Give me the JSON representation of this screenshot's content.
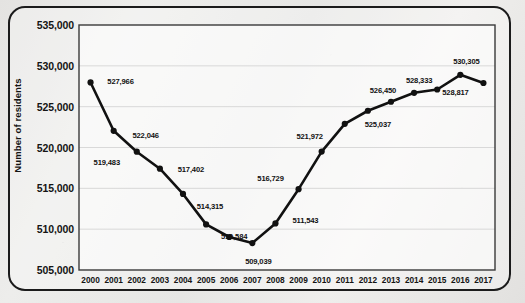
{
  "chart_data": {
    "type": "line",
    "title": "",
    "xlabel": "",
    "ylabel": "Number of residents",
    "ylim": [
      505000,
      535000
    ],
    "ytick_labels": [
      "535,000",
      "530,000",
      "525,000",
      "520,000",
      "515,000",
      "510,000",
      "505,000"
    ],
    "ytick_values": [
      535000,
      530000,
      525000,
      520000,
      515000,
      510000,
      505000
    ],
    "grid": true,
    "legend": "none",
    "categories": [
      "2000",
      "2001",
      "2002",
      "2003",
      "2004",
      "2005",
      "2006",
      "2007",
      "2008",
      "2009",
      "2010",
      "2011",
      "2012",
      "2013",
      "2014",
      "2015",
      "2016",
      "2017"
    ],
    "values": [
      527966,
      522046,
      519483,
      517402,
      514315,
      510584,
      509039,
      509039,
      511543,
      516729,
      521972,
      525037,
      526450,
      528333,
      528333,
      530305,
      530305,
      528817
    ],
    "points": [
      {
        "x": "2000",
        "y": 527966,
        "label": "527,966",
        "lx": 30,
        "ly": -1
      },
      {
        "x": "2001",
        "y": 522046,
        "label": "522,046",
        "lx": 32,
        "ly": 4
      },
      {
        "x": "2002",
        "y": 519483,
        "label": "519,483",
        "lx": -30,
        "ly": 10
      },
      {
        "x": "2003",
        "y": 517402,
        "label": "517,402",
        "lx": 31,
        "ly": 0
      },
      {
        "x": "2004",
        "y": 514315,
        "label": "514,315",
        "lx": 27,
        "ly": 12
      },
      {
        "x": "2005",
        "y": 510584,
        "label": "510,584",
        "lx": 28,
        "ly": 12
      },
      {
        "x": "2006",
        "y": 509039,
        "label": "",
        "lx": 0,
        "ly": 0
      },
      {
        "x": "2007",
        "y": 508300,
        "label": "509,039",
        "lx": 6,
        "ly": 18
      },
      {
        "x": "2008",
        "y": 510700,
        "label": "511,543",
        "lx": 30,
        "ly": -3
      },
      {
        "x": "2009",
        "y": 514900,
        "label": "516,729",
        "lx": -28,
        "ly": -11
      },
      {
        "x": "2010",
        "y": 519500,
        "label": "521,972",
        "lx": -12,
        "ly": -16
      },
      {
        "x": "2011",
        "y": 522900,
        "label": "",
        "lx": 0,
        "ly": 0
      },
      {
        "x": "2012",
        "y": 524500,
        "label": "525,037",
        "lx": 10,
        "ly": 13
      },
      {
        "x": "2013",
        "y": 525600,
        "label": "526,450",
        "lx": -8,
        "ly": -12
      },
      {
        "x": "2014",
        "y": 526700,
        "label": "528,333",
        "lx": 5,
        "ly": -13
      },
      {
        "x": "2015",
        "y": 527100,
        "label": "",
        "lx": 0,
        "ly": 0
      },
      {
        "x": "2016",
        "y": 528900,
        "label": "530,305",
        "lx": 6,
        "ly": -14
      },
      {
        "x": "2017",
        "y": 527900,
        "label": "528,817",
        "lx": -28,
        "ly": 9
      }
    ],
    "data_labels": [
      "527,966",
      "522,046",
      "519,483",
      "517,402",
      "514,315",
      "510,584",
      "509,039",
      "511,543",
      "516,729",
      "521,972",
      "525,037",
      "526,450",
      "528,333",
      "530,305",
      "528,817"
    ],
    "series_color": "#111111",
    "marker_color": "#111111",
    "grid_color": "#d5d5d5",
    "axis_color": "#333333"
  }
}
